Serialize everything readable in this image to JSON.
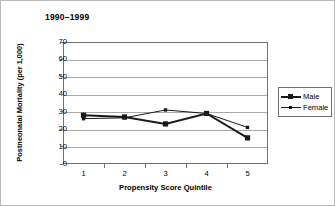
{
  "chart_data": {
    "type": "line",
    "title": "1990–1999",
    "xlabel": "Propensity Score Quintile",
    "ylabel": "Postneonatal Mortality (per 1,000)",
    "categories": [
      "1",
      "2",
      "3",
      "4",
      "5"
    ],
    "x": [
      1,
      2,
      3,
      4,
      5
    ],
    "ylim": [
      0,
      70
    ],
    "ytick_values": [
      70,
      60,
      50,
      40,
      30,
      20,
      10,
      0
    ],
    "ytick_labels": [
      "70",
      "60",
      "50",
      "40",
      "30",
      "20",
      "10",
      "0"
    ],
    "grid": "horizontal",
    "legend_position": "right",
    "series": [
      {
        "name": "Male",
        "values": [
          28,
          27,
          23,
          29,
          15
        ],
        "color": "#1a1a1a",
        "marker": "filled-square",
        "line_width": 2
      },
      {
        "name": "Female",
        "values": [
          26,
          26.5,
          31,
          29,
          21
        ],
        "color": "#1a1a1a",
        "marker": "small-square",
        "line_width": 1
      }
    ]
  },
  "legend": {
    "entries": [
      {
        "label": "Male"
      },
      {
        "label": "Female"
      }
    ]
  },
  "colors": {
    "series": "#1a1a1a",
    "grid": "#a8a8a8",
    "axis": "#6f6f6f",
    "frame": "#b9b9b9",
    "background": "#ffffff"
  }
}
